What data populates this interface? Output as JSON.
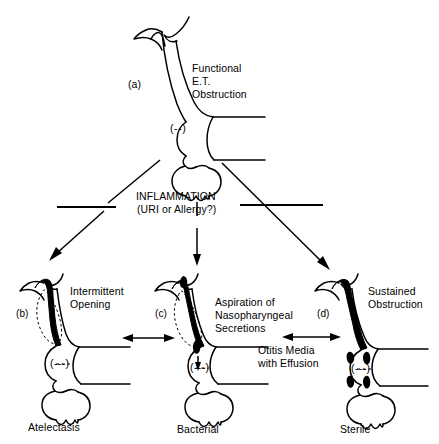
{
  "figure": {
    "background_color": "#ffffff",
    "ink_color": "#000000"
  },
  "top_panel": {
    "panel_letter": "(a)",
    "caption_line1": "Functional",
    "caption_line2": "E.T.",
    "caption_line3": "Obstruction",
    "middle_ear_pressure": "(--)"
  },
  "central_process": {
    "line1": "INFLAMMATION",
    "line2": "(URI or Allergy?)"
  },
  "panels": [
    {
      "panel_letter": "(b)",
      "caption_line1": "Intermittent",
      "caption_line2": "Opening",
      "middle_ear_pressure": "(---)",
      "outcome": "Atelectasis"
    },
    {
      "panel_letter": "(c)",
      "caption_line1": "Aspiration of",
      "caption_line2": "Nasopharyngeal",
      "caption_line3": "Secretions",
      "middle_ear_pressure": "(---)",
      "outcome": "Bacterial"
    },
    {
      "panel_letter": "(d)",
      "caption_line1": "Sustained",
      "caption_line2": "Obstruction",
      "middle_ear_pressure": "(---)",
      "outcome": "Sterile"
    }
  ],
  "effusion_label": {
    "line1": "Otitis Media",
    "line2": "with Effusion"
  }
}
